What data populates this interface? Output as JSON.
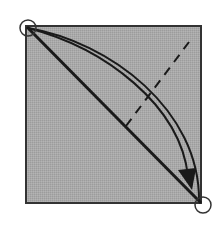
{
  "diagram": {
    "type": "origami-fold-step",
    "colors": {
      "paper_fill": "#a9a9a9",
      "paper_border": "#333333",
      "line": "#1a1a1a",
      "background": "#ffffff"
    },
    "paper": {
      "x": 26,
      "y": 26,
      "width": 175,
      "height": 177
    },
    "markers": [
      {
        "name": "top-left-corner-circle",
        "cx": 28,
        "cy": 28,
        "r": 8
      },
      {
        "name": "bottom-right-corner-circle",
        "cx": 203,
        "cy": 205,
        "r": 8
      }
    ],
    "lines": {
      "diagonal_crease": {
        "x1": 27,
        "y1": 27,
        "x2": 201,
        "y2": 203
      },
      "valley_fold_dashed": {
        "x1": 126,
        "y1": 126,
        "x2": 192,
        "y2": 38
      }
    },
    "arrow": {
      "label": "fold corner to corner",
      "from": [
        28,
        28
      ],
      "to": [
        196,
        198
      ]
    }
  }
}
